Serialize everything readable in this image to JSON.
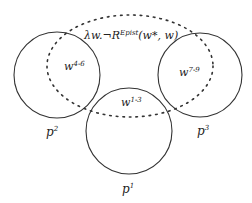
{
  "diagram": {
    "formula": {
      "prefix": "λw.¬R",
      "superscript": "Epist",
      "suffix": "(w*, w)"
    },
    "circles": [
      {
        "id": "p2",
        "label_base": "p",
        "label_sup": "2",
        "world_base": "w",
        "world_sup": "4-6"
      },
      {
        "id": "p3",
        "label_base": "p",
        "label_sup": "3",
        "world_base": "w",
        "world_sup": "7-9"
      },
      {
        "id": "p1",
        "label_base": "p",
        "label_sup": "1",
        "world_base": "w",
        "world_sup": "1-3"
      }
    ],
    "colors": {
      "stroke": "#333333",
      "background": "#ffffff"
    }
  }
}
